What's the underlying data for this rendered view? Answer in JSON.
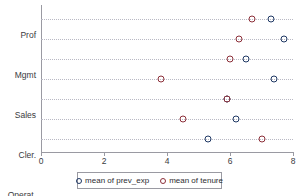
{
  "chart_data": {
    "type": "scatter",
    "title": "",
    "xlabel": "",
    "ylabel": "",
    "orientation": "horizontal",
    "grid": true,
    "legend_position": "bottom",
    "xlim": [
      0,
      8
    ],
    "xticks": [
      0,
      2,
      4,
      6,
      8
    ],
    "xtick_labels": [
      "0",
      "2",
      "4",
      "6",
      "8"
    ],
    "categories": [
      "Prof",
      "Mgmt",
      "Sales",
      "Cler.",
      "Operat.",
      "Labor",
      "Other"
    ],
    "series": [
      {
        "name": "mean of prev_exp",
        "color": "#1f3864",
        "marker": "open-circle",
        "values": [
          7.3,
          7.7,
          6.5,
          7.4,
          5.9,
          6.2,
          5.3
        ]
      },
      {
        "name": "mean of tenure",
        "color": "#8c2f39",
        "marker": "open-circle",
        "values": [
          6.7,
          6.3,
          6.0,
          3.8,
          5.9,
          4.5,
          7.0
        ]
      }
    ]
  },
  "legend": {
    "entries": [
      {
        "label": "mean of prev_exp",
        "marker_name": "legend-marker-prev-exp"
      },
      {
        "label": "mean of tenure",
        "marker_name": "legend-marker-tenure"
      }
    ]
  }
}
